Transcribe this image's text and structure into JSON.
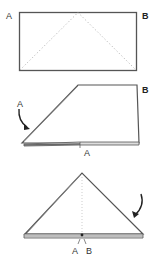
{
  "diagram": {
    "type": "folding-instructions",
    "steps": [
      {
        "id": "step-1",
        "description": "Rectangle with dotted diagonal fold guides from bottom corners to top center",
        "labels": {
          "left": "A",
          "right": "B"
        }
      },
      {
        "id": "step-2",
        "description": "Left corner A folded down to the bottom edge",
        "labels": {
          "arrow": "A",
          "right": "B",
          "inner": "A"
        }
      },
      {
        "id": "step-3",
        "description": "Right side folded down to form a triangle; corners A and B meet at center bottom",
        "labels": {
          "left": "A",
          "right": "B"
        }
      }
    ],
    "colors": {
      "line": "#555555",
      "fold_guide": "#b0b0b0",
      "background": "#ffffff"
    }
  }
}
